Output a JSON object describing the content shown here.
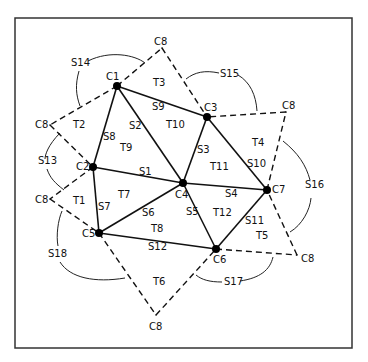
{
  "diagram": {
    "frame": {
      "x": 15,
      "y": 18,
      "w": 337,
      "h": 330
    },
    "nodes": [
      {
        "id": "C1",
        "x": 117,
        "y": 86,
        "label": "C1",
        "lx": 106,
        "ly": 80
      },
      {
        "id": "C2",
        "x": 93,
        "y": 167,
        "label": "C2",
        "lx": 76,
        "ly": 170
      },
      {
        "id": "C3",
        "x": 207,
        "y": 117,
        "label": "C3",
        "lx": 204,
        "ly": 111
      },
      {
        "id": "C4",
        "x": 183,
        "y": 183,
        "label": "C4",
        "lx": 175,
        "ly": 198
      },
      {
        "id": "C5",
        "x": 99,
        "y": 233,
        "label": "C5",
        "lx": 82,
        "ly": 237
      },
      {
        "id": "C6",
        "x": 216,
        "y": 249,
        "label": "C6",
        "lx": 213,
        "ly": 263
      },
      {
        "id": "C7",
        "x": 267,
        "y": 190,
        "label": "C7",
        "lx": 272,
        "ly": 193
      }
    ],
    "c8_points": [
      {
        "x": 162,
        "y": 48,
        "label": "C8",
        "lx": 154,
        "ly": 45
      },
      {
        "x": 50,
        "y": 125,
        "label": "C8",
        "lx": 35,
        "ly": 128
      },
      {
        "x": 50,
        "y": 199,
        "label": "C8",
        "lx": 35,
        "ly": 203
      },
      {
        "x": 156,
        "y": 315,
        "label": "C8",
        "lx": 149,
        "ly": 330
      },
      {
        "x": 286,
        "y": 112,
        "label": "C8",
        "lx": 282,
        "ly": 109
      },
      {
        "x": 297,
        "y": 255,
        "label": "C8",
        "lx": 301,
        "ly": 262
      }
    ],
    "solid_edges": [
      {
        "id": "S1",
        "from": "C2",
        "to": "C4",
        "label": "S1",
        "lx": 139,
        "ly": 175
      },
      {
        "id": "S2",
        "from": "C1",
        "to": "C4",
        "label": "S2",
        "lx": 129,
        "ly": 129
      },
      {
        "id": "S3",
        "from": "C3",
        "to": "C4",
        "label": "S3",
        "lx": 197,
        "ly": 153
      },
      {
        "id": "S4",
        "from": "C4",
        "to": "C7",
        "label": "S4",
        "lx": 225,
        "ly": 197
      },
      {
        "id": "S5",
        "from": "C4",
        "to": "C6",
        "label": "S5",
        "lx": 186,
        "ly": 215
      },
      {
        "id": "S6",
        "from": "C4",
        "to": "C5",
        "label": "S6",
        "lx": 142,
        "ly": 216
      },
      {
        "id": "S7",
        "from": "C2",
        "to": "C5",
        "label": "S7",
        "lx": 98,
        "ly": 210
      },
      {
        "id": "S8",
        "from": "C1",
        "to": "C2",
        "label": "S8",
        "lx": 103,
        "ly": 140
      },
      {
        "id": "S9",
        "from": "C1",
        "to": "C3",
        "label": "S9",
        "lx": 152,
        "ly": 110
      },
      {
        "id": "S10",
        "from": "C3",
        "to": "C7",
        "label": "S10",
        "lx": 247,
        "ly": 167
      },
      {
        "id": "S11",
        "from": "C6",
        "to": "C7",
        "label": "S11",
        "lx": 245,
        "ly": 224
      },
      {
        "id": "S12",
        "from": "C5",
        "to": "C6",
        "label": "S12",
        "lx": 148,
        "ly": 250
      }
    ],
    "dashed_edges": [
      {
        "from": [
          117,
          86
        ],
        "to": [
          162,
          48
        ]
      },
      {
        "from": [
          162,
          48
        ],
        "to": [
          207,
          117
        ]
      },
      {
        "from": [
          117,
          86
        ],
        "to": [
          50,
          125
        ]
      },
      {
        "from": [
          50,
          125
        ],
        "to": [
          93,
          167
        ]
      },
      {
        "from": [
          93,
          167
        ],
        "to": [
          50,
          199
        ]
      },
      {
        "from": [
          50,
          199
        ],
        "to": [
          99,
          233
        ]
      },
      {
        "from": [
          99,
          233
        ],
        "to": [
          156,
          315
        ]
      },
      {
        "from": [
          156,
          315
        ],
        "to": [
          216,
          249
        ]
      },
      {
        "from": [
          216,
          249
        ],
        "to": [
          297,
          255
        ]
      },
      {
        "from": [
          297,
          255
        ],
        "to": [
          267,
          190
        ]
      },
      {
        "from": [
          267,
          190
        ],
        "to": [
          286,
          112
        ]
      },
      {
        "from": [
          286,
          112
        ],
        "to": [
          207,
          117
        ]
      }
    ],
    "triangles": [
      {
        "label": "T1",
        "x": 73,
        "y": 204
      },
      {
        "label": "T2",
        "x": 73,
        "y": 128
      },
      {
        "label": "T3",
        "x": 153,
        "y": 86
      },
      {
        "label": "T4",
        "x": 252,
        "y": 146
      },
      {
        "label": "T5",
        "x": 256,
        "y": 239
      },
      {
        "label": "T6",
        "x": 153,
        "y": 285
      },
      {
        "label": "T7",
        "x": 118,
        "y": 198
      },
      {
        "label": "T8",
        "x": 151,
        "y": 232
      },
      {
        "label": "T9",
        "x": 120,
        "y": 151
      },
      {
        "label": "T10",
        "x": 166,
        "y": 128
      },
      {
        "label": "T11",
        "x": 210,
        "y": 170
      },
      {
        "label": "T12",
        "x": 213,
        "y": 216
      }
    ],
    "boundary_labels": [
      {
        "label": "S13",
        "x": 38,
        "y": 164
      },
      {
        "label": "S14",
        "x": 71,
        "y": 66
      },
      {
        "label": "S15",
        "x": 220,
        "y": 77
      },
      {
        "label": "S16",
        "x": 305,
        "y": 188
      },
      {
        "label": "S17",
        "x": 224,
        "y": 285
      },
      {
        "label": "S18",
        "x": 48,
        "y": 257
      }
    ],
    "arcs": [
      {
        "name": "S14-arc",
        "d": "M 88 61 C 110 50, 135 55, 145 63"
      },
      {
        "name": "S14-arc-2",
        "d": "M 79 71 C 75 85, 76 95, 80 106"
      },
      {
        "name": "S13-arc",
        "d": "M 60 133 C 48 145, 45 155, 45 159"
      },
      {
        "name": "S13-arc-2",
        "d": "M 47 169 C 50 178, 55 183, 64 190"
      },
      {
        "name": "S15-arc",
        "d": "M 219 73 C 205 70, 195 72, 186 79"
      },
      {
        "name": "S15-arc-2",
        "d": "M 238 75 C 250 82, 256 95, 257 111"
      },
      {
        "name": "S16-arc",
        "d": "M 310 180 C 306 165, 298 153, 283 141"
      },
      {
        "name": "S16-arc-2",
        "d": "M 311 198 C 310 210, 302 225, 290 232"
      },
      {
        "name": "S17-arc",
        "d": "M 222 282 C 210 282, 202 280, 196 275"
      },
      {
        "name": "S17-arc-2",
        "d": "M 240 281 C 260 278, 270 270, 273 257"
      },
      {
        "name": "S18-arc",
        "d": "M 58 246 C 56 236, 58 220, 62 211"
      },
      {
        "name": "S18-arc-2",
        "d": "M 60 262 C 70 278, 95 283, 125 278"
      }
    ]
  }
}
